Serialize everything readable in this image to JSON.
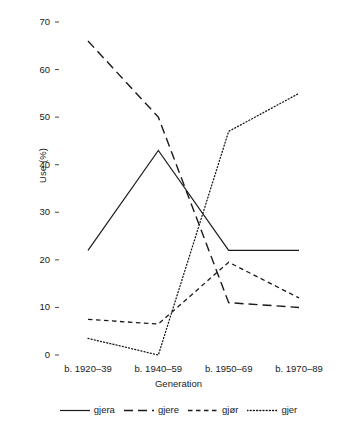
{
  "chart_data": {
    "type": "line",
    "title": "",
    "xlabel": "Generation",
    "ylabel": "Use (%)",
    "categories": [
      "b. 1920–39",
      "b. 1940–59",
      "b. 1950–69",
      "b. 1970–89"
    ],
    "yticks": [
      0,
      10,
      20,
      30,
      40,
      50,
      60,
      70
    ],
    "ylim": [
      0,
      70
    ],
    "grid": false,
    "legend_position": "bottom",
    "series": [
      {
        "name": "gjera",
        "style": "solid",
        "color": "#1a1a1a",
        "values": [
          22,
          43,
          22,
          22
        ]
      },
      {
        "name": "gjere",
        "style": "long-dash",
        "color": "#1a1a1a",
        "values": [
          66,
          50,
          11,
          10
        ]
      },
      {
        "name": "gjør",
        "style": "short-dash",
        "color": "#1a1a1a",
        "values": [
          7.5,
          6.5,
          19.5,
          12
        ]
      },
      {
        "name": "gjer",
        "style": "dotted",
        "color": "#1a1a1a",
        "values": [
          3.5,
          0,
          47,
          55
        ]
      }
    ]
  }
}
